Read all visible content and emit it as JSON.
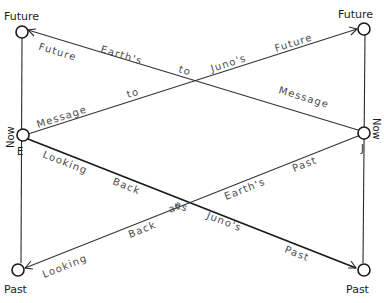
{
  "diagram": {
    "type": "hand-drawn spacetime communication diagram",
    "worldlines": {
      "left": {
        "name": "Earth",
        "side_label_now": "Now",
        "side_label_initial": "E",
        "top_label": "Future",
        "bottom_label": "Past"
      },
      "right": {
        "name": "Juno",
        "side_label_now": "Now",
        "side_label_initial": "J",
        "top_label": "Future",
        "bottom_label": "Past"
      }
    },
    "signals": [
      {
        "id": "juno-to-earth-future",
        "from": "Juno Now",
        "to": "Earth Future",
        "labels": [
          "Future",
          "Earth's",
          "to",
          "Message"
        ]
      },
      {
        "id": "earth-to-juno-future",
        "from": "Earth Now",
        "to": "Juno Future",
        "labels": [
          "Message",
          "to",
          "Juno's",
          "Future"
        ]
      },
      {
        "id": "earth-looking-back-juno-past",
        "from": "Earth Now",
        "to": "Juno Past",
        "labels": [
          "Looking",
          "Back",
          "at",
          "Juno's",
          "Past"
        ]
      },
      {
        "id": "juno-looking-back-earth-past",
        "from": "Juno Now",
        "to": "Earth Past",
        "labels": [
          "Looking",
          "Back",
          "at",
          "Earth's",
          "Past"
        ]
      }
    ],
    "text": {
      "earth_future": "Future",
      "juno_future": "Future",
      "earth_past": "Past",
      "juno_past": "Past",
      "earth_now": "Now",
      "earth_initial": "E",
      "juno_now": "Now",
      "juno_initial": "J",
      "sigA_future": "Future",
      "sigA_earths": "Earth's",
      "sigA_to": "to",
      "sigA_message": "Message",
      "sigB_message": "Message",
      "sigB_to": "to",
      "sigB_junos": "Juno's",
      "sigB_future": "Future",
      "sigC_looking": "Looking",
      "sigC_back": "Back",
      "sigC_as": "as",
      "sigC_junos": "Juno's",
      "sigC_past": "Past",
      "sigD_looking": "Looking",
      "sigD_back": "Back",
      "sigD_at": "at",
      "sigD_earths": "Earth's",
      "sigD_past": "Past"
    }
  }
}
